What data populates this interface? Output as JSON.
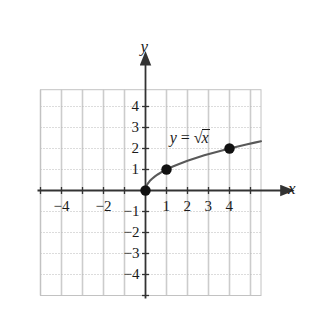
{
  "figure": {
    "equation_label": {
      "lhs": "y",
      "operator": "=",
      "radical_sign": "√",
      "radicand": "x",
      "full_text": "y = √x"
    },
    "axis_names": {
      "x": "x",
      "y": "y"
    },
    "colors": {
      "curve": "#595959",
      "point": "#111111",
      "axis": "#333333",
      "grid_vertical": "#cccccc",
      "grid_horizontal": "#b8b8b8",
      "text": "#1a1a1a",
      "background": "#ffffff"
    }
  },
  "chart_data": {
    "type": "line",
    "title": "",
    "xlabel": "x",
    "ylabel": "y",
    "function": "y = sqrt(x)",
    "xlim": [
      -5,
      5.5
    ],
    "ylim": [
      -5,
      4.8
    ],
    "grid": true,
    "legend": null,
    "x_ticks": [
      -4,
      -2,
      1,
      2,
      3,
      4
    ],
    "x_tick_labels": [
      "−4",
      "−2",
      "1",
      "2",
      "3",
      "4"
    ],
    "y_ticks": [
      4,
      3,
      2,
      1,
      -1,
      -2,
      -3,
      -4
    ],
    "y_tick_labels": [
      "4",
      "3",
      "2",
      "1",
      "−1",
      "−2",
      "−3",
      "−4"
    ],
    "series": [
      {
        "name": "y = √x",
        "x": [
          0,
          0.05,
          0.1,
          0.2,
          0.3,
          0.45,
          0.6,
          0.8,
          1,
          1.3,
          1.6,
          2,
          2.4,
          2.8,
          3.2,
          3.6,
          4,
          4.4,
          4.8,
          5.2,
          5.5
        ],
        "y": [
          0,
          0.2236,
          0.3162,
          0.4472,
          0.5477,
          0.6708,
          0.7746,
          0.8944,
          1,
          1.1402,
          1.2649,
          1.4142,
          1.5492,
          1.6733,
          1.7889,
          1.8974,
          2,
          2.0976,
          2.1909,
          2.2804,
          2.3452
        ]
      }
    ],
    "points": [
      {
        "label": "(0, 0)",
        "x": 0,
        "y": 0
      },
      {
        "label": "(1, 1)",
        "x": 1,
        "y": 1
      },
      {
        "label": "(4, 2)",
        "x": 4,
        "y": 2
      }
    ],
    "annotations": [
      {
        "text": "y = √x",
        "x": 1.15,
        "y": 2.55
      }
    ]
  }
}
